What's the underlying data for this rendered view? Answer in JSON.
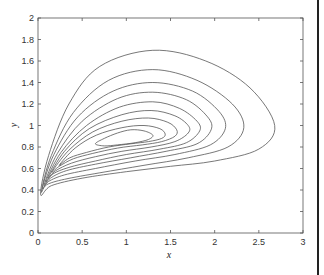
{
  "chart_data": {
    "type": "line",
    "subtype": "contour / phase portrait",
    "title": "",
    "xlabel": "x",
    "ylabel": "y",
    "xlim": [
      0,
      3
    ],
    "ylim": [
      0,
      2
    ],
    "xticks": [
      "0",
      "0.5",
      "1",
      "1.5",
      "2",
      "2.5",
      "3"
    ],
    "yticks": [
      "0",
      "0.2",
      "0.4",
      "0.6",
      "0.8",
      "1",
      "1.2",
      "1.4",
      "1.6",
      "1.8",
      "2"
    ],
    "grid": false,
    "legend": null,
    "center": [
      1.0,
      0.88
    ],
    "series": [
      {
        "name": "orbit-1",
        "points": [
          [
            0.03,
            0.36
          ],
          [
            0.12,
            0.72
          ],
          [
            0.35,
            1.2
          ],
          [
            0.7,
            1.55
          ],
          [
            1.3,
            1.7
          ],
          [
            1.9,
            1.6
          ],
          [
            2.4,
            1.35
          ],
          [
            2.68,
            1.0
          ],
          [
            2.5,
            0.78
          ],
          [
            2.0,
            0.67
          ],
          [
            1.5,
            0.62
          ],
          [
            1.0,
            0.57
          ],
          [
            0.5,
            0.51
          ],
          [
            0.15,
            0.44
          ]
        ]
      },
      {
        "name": "orbit-2",
        "points": [
          [
            0.04,
            0.39
          ],
          [
            0.15,
            0.72
          ],
          [
            0.4,
            1.12
          ],
          [
            0.8,
            1.42
          ],
          [
            1.3,
            1.52
          ],
          [
            1.8,
            1.42
          ],
          [
            2.2,
            1.2
          ],
          [
            2.33,
            0.98
          ],
          [
            2.15,
            0.8
          ],
          [
            1.7,
            0.7
          ],
          [
            1.2,
            0.63
          ],
          [
            0.7,
            0.56
          ],
          [
            0.3,
            0.5
          ],
          [
            0.1,
            0.45
          ]
        ]
      },
      {
        "name": "orbit-3",
        "points": [
          [
            0.05,
            0.42
          ],
          [
            0.18,
            0.73
          ],
          [
            0.45,
            1.08
          ],
          [
            0.85,
            1.32
          ],
          [
            1.3,
            1.4
          ],
          [
            1.75,
            1.32
          ],
          [
            2.05,
            1.13
          ],
          [
            2.12,
            0.97
          ],
          [
            1.95,
            0.82
          ],
          [
            1.55,
            0.73
          ],
          [
            1.1,
            0.67
          ],
          [
            0.65,
            0.6
          ],
          [
            0.3,
            0.54
          ],
          [
            0.12,
            0.48
          ]
        ]
      },
      {
        "name": "orbit-4",
        "points": [
          [
            0.07,
            0.45
          ],
          [
            0.22,
            0.74
          ],
          [
            0.5,
            1.04
          ],
          [
            0.9,
            1.25
          ],
          [
            1.3,
            1.31
          ],
          [
            1.68,
            1.24
          ],
          [
            1.92,
            1.08
          ],
          [
            1.96,
            0.96
          ],
          [
            1.8,
            0.83
          ],
          [
            1.45,
            0.76
          ],
          [
            1.05,
            0.7
          ],
          [
            0.65,
            0.64
          ],
          [
            0.32,
            0.58
          ],
          [
            0.14,
            0.51
          ]
        ]
      },
      {
        "name": "orbit-5",
        "points": [
          [
            0.09,
            0.48
          ],
          [
            0.26,
            0.75
          ],
          [
            0.55,
            1.0
          ],
          [
            0.92,
            1.17
          ],
          [
            1.3,
            1.22
          ],
          [
            1.6,
            1.16
          ],
          [
            1.8,
            1.04
          ],
          [
            1.83,
            0.95
          ],
          [
            1.68,
            0.84
          ],
          [
            1.38,
            0.78
          ],
          [
            1.0,
            0.73
          ],
          [
            0.65,
            0.67
          ],
          [
            0.35,
            0.61
          ],
          [
            0.17,
            0.55
          ]
        ]
      },
      {
        "name": "orbit-6",
        "points": [
          [
            0.12,
            0.52
          ],
          [
            0.3,
            0.76
          ],
          [
            0.58,
            0.97
          ],
          [
            0.95,
            1.1
          ],
          [
            1.28,
            1.14
          ],
          [
            1.55,
            1.09
          ],
          [
            1.7,
            1.0
          ],
          [
            1.7,
            0.93
          ],
          [
            1.55,
            0.85
          ],
          [
            1.28,
            0.8
          ],
          [
            0.95,
            0.76
          ],
          [
            0.65,
            0.71
          ],
          [
            0.38,
            0.65
          ],
          [
            0.2,
            0.58
          ]
        ]
      },
      {
        "name": "orbit-7",
        "points": [
          [
            0.16,
            0.57
          ],
          [
            0.35,
            0.77
          ],
          [
            0.62,
            0.94
          ],
          [
            0.95,
            1.04
          ],
          [
            1.25,
            1.07
          ],
          [
            1.47,
            1.03
          ],
          [
            1.57,
            0.96
          ],
          [
            1.55,
            0.9
          ],
          [
            1.4,
            0.85
          ],
          [
            1.18,
            0.82
          ],
          [
            0.9,
            0.79
          ],
          [
            0.62,
            0.74
          ],
          [
            0.4,
            0.69
          ],
          [
            0.24,
            0.62
          ]
        ]
      },
      {
        "name": "orbit-8",
        "points": [
          [
            0.24,
            0.63
          ],
          [
            0.42,
            0.79
          ],
          [
            0.66,
            0.91
          ],
          [
            0.95,
            0.98
          ],
          [
            1.2,
            1.0
          ],
          [
            1.38,
            0.97
          ],
          [
            1.44,
            0.92
          ],
          [
            1.4,
            0.88
          ],
          [
            1.25,
            0.85
          ],
          [
            1.05,
            0.83
          ],
          [
            0.8,
            0.8
          ],
          [
            0.55,
            0.75
          ],
          [
            0.36,
            0.7
          ]
        ]
      },
      {
        "name": "orbit-9",
        "points": [
          [
            0.65,
            0.83
          ],
          [
            0.75,
            0.88
          ],
          [
            0.9,
            0.93
          ],
          [
            1.05,
            0.96
          ],
          [
            1.2,
            0.95
          ],
          [
            1.3,
            0.91
          ],
          [
            1.25,
            0.87
          ],
          [
            1.1,
            0.84
          ],
          [
            0.9,
            0.82
          ],
          [
            0.75,
            0.81
          ]
        ]
      }
    ]
  },
  "window": {
    "right_edge_bar": true
  }
}
